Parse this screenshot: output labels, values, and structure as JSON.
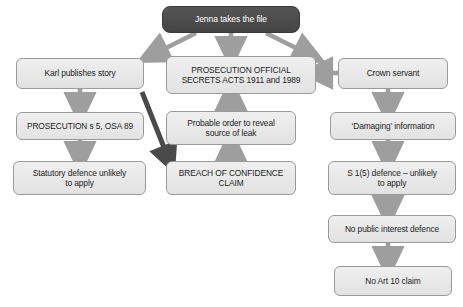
{
  "diagram": {
    "title": "Jenna takes the file",
    "colors": {
      "root_fill": "#4a4a4a",
      "root_text": "#ffffff",
      "node_fill": "#e8e8e8",
      "node_border": "#9a9a9a",
      "node_text": "#1d1d1d",
      "arrow_light": "#9e9e9e",
      "arrow_dark": "#4a4a4a",
      "background": "#ffffff"
    },
    "nodes": {
      "root": "Jenna takes the file",
      "karl_publishes": "Karl publishes story",
      "prosecution_osa": "PROSECUTION OFFICIAL\nSECRETS ACTS 1911 and 1989",
      "crown_servant": "Crown servant",
      "prosecution_s5": "PROSECUTION s 5, OSA 89",
      "probable_order": "Probable order to reveal\nsource of leak",
      "damaging_information": "‘Damaging’ information",
      "statutory_defence": "Statutory defence unlikely\nto apply",
      "breach_confidence": "BREACH OF CONFIDENCE\nCLAIM",
      "s15_defence": "S 1(5) defence – unlikely\nto apply",
      "no_public_interest": "No public interest defence",
      "no_art10": "No Art 10 claim"
    },
    "edges": [
      {
        "from": "root",
        "to": "karl_publishes",
        "style": "light",
        "direction": "diagonal-left"
      },
      {
        "from": "root",
        "to": "prosecution_osa",
        "style": "light",
        "direction": "down"
      },
      {
        "from": "root",
        "to": "crown_servant",
        "style": "light",
        "direction": "diagonal-right"
      },
      {
        "from": "crown_servant",
        "to": "prosecution_osa",
        "style": "light",
        "direction": "left"
      },
      {
        "from": "karl_publishes",
        "to": "prosecution_s5",
        "style": "light",
        "direction": "down"
      },
      {
        "from": "karl_publishes",
        "to": "breach_confidence",
        "style": "dark",
        "direction": "diagonal-right-down"
      },
      {
        "from": "prosecution_s5",
        "to": "statutory_defence",
        "style": "light",
        "direction": "down"
      },
      {
        "from": "breach_confidence",
        "to": "probable_order",
        "style": "light",
        "direction": "up"
      },
      {
        "from": "probable_order",
        "to": "prosecution_osa",
        "style": "light",
        "direction": "up"
      },
      {
        "from": "crown_servant",
        "to": "damaging_information",
        "style": "light",
        "direction": "down"
      },
      {
        "from": "damaging_information",
        "to": "s15_defence",
        "style": "light",
        "direction": "down"
      },
      {
        "from": "s15_defence",
        "to": "no_public_interest",
        "style": "light",
        "direction": "down"
      },
      {
        "from": "no_public_interest",
        "to": "no_art10",
        "style": "light",
        "direction": "down"
      }
    ]
  }
}
